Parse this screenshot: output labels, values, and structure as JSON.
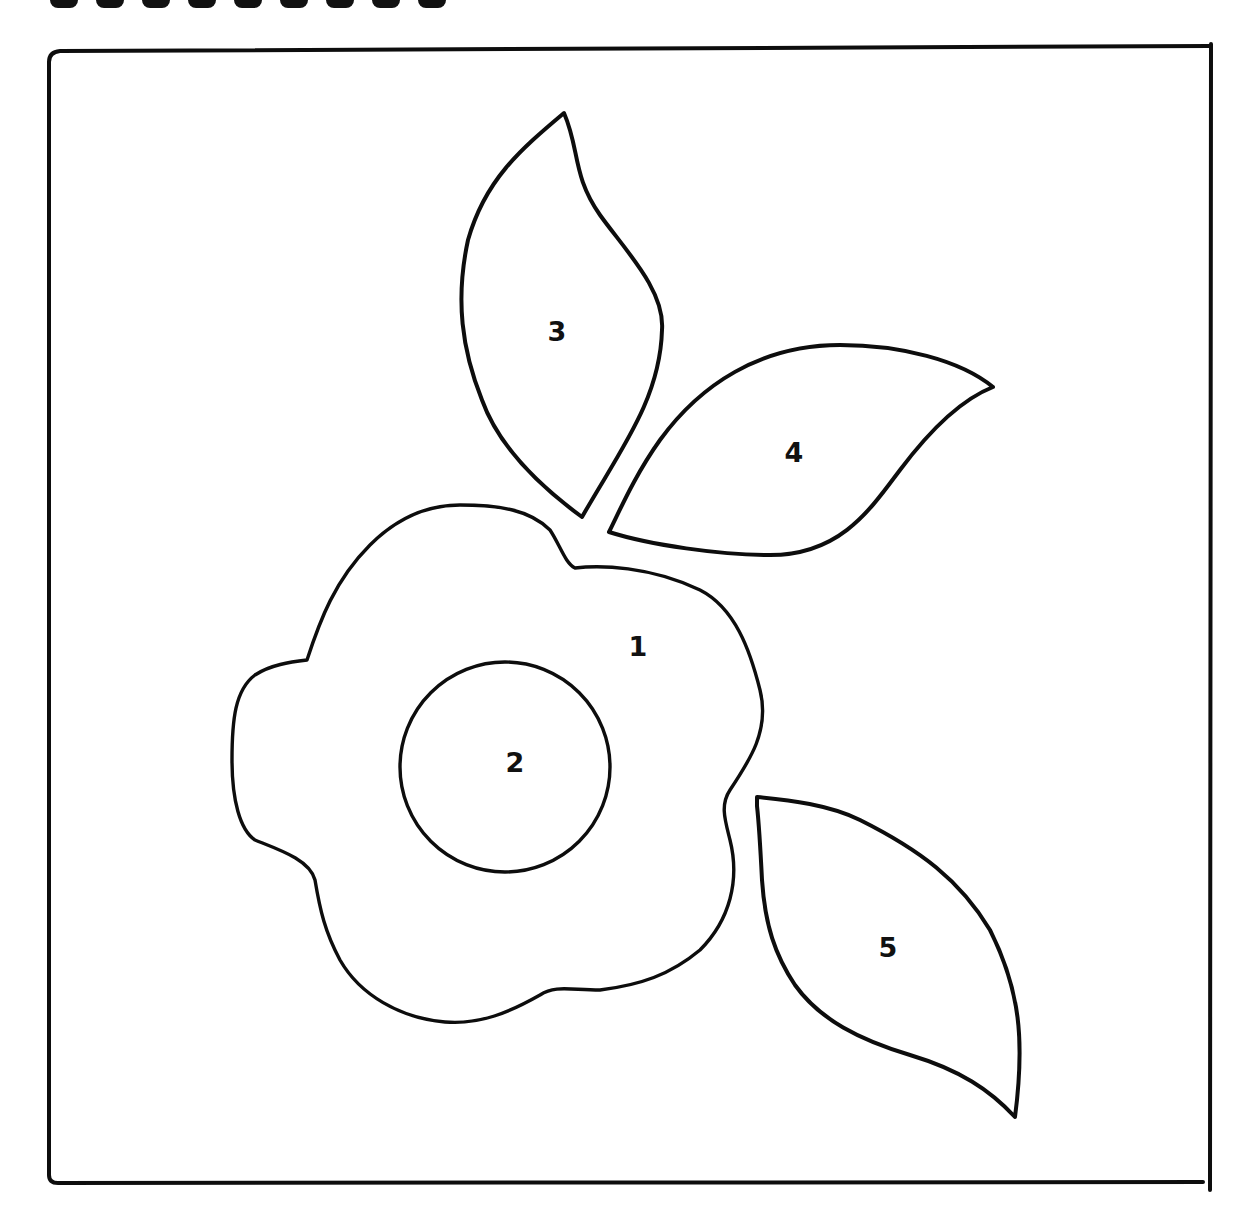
{
  "page": {
    "title_visible": false
  },
  "pieces": [
    {
      "id": 1,
      "label": "1",
      "shape": "flower",
      "label_pos": [
        638,
        646
      ]
    },
    {
      "id": 2,
      "label": "2",
      "shape": "circle-center",
      "label_pos": [
        515,
        762
      ]
    },
    {
      "id": 3,
      "label": "3",
      "shape": "leaf",
      "label_pos": [
        557,
        331
      ]
    },
    {
      "id": 4,
      "label": "4",
      "shape": "leaf",
      "label_pos": [
        794,
        452
      ]
    },
    {
      "id": 5,
      "label": "5",
      "shape": "leaf",
      "label_pos": [
        888,
        947
      ]
    }
  ],
  "colors": {
    "line": "#0d0d0d",
    "background": "#ffffff"
  }
}
